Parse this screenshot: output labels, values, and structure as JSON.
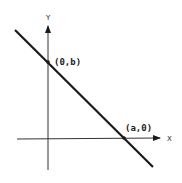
{
  "diagram": {
    "type": "intercept-form line graph",
    "axes": {
      "x_label": "X",
      "y_label": "Y"
    },
    "points": [
      {
        "label": "(0,b)",
        "meaning": "y-intercept"
      },
      {
        "label": "(a,0)",
        "meaning": "x-intercept"
      }
    ],
    "colors": {
      "line": "#1a1a1a",
      "axes": "#333333",
      "background": "#ffffff"
    }
  }
}
